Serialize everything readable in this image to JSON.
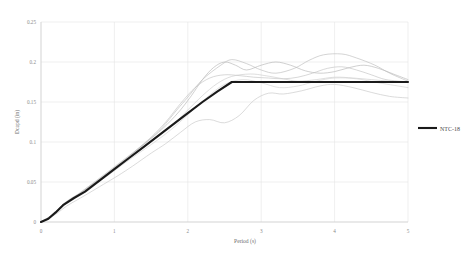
{
  "chart_data": {
    "type": "line",
    "title": "",
    "xlabel": "Period (s)",
    "ylabel": "Dcapd (in)",
    "xlim": [
      0,
      5
    ],
    "ylim": [
      0,
      0.25
    ],
    "xticks": [
      "0",
      "1",
      "2",
      "3",
      "4",
      "5"
    ],
    "yticks": [
      "0",
      "0.05",
      "0.1",
      "0.15",
      "0.2",
      "0.25"
    ],
    "grid": true,
    "legend_position": "right",
    "legend": [
      {
        "name": "NTC-18",
        "color": "#1a1a1a",
        "style": "solid-bold"
      }
    ],
    "series": [
      {
        "name": "NTC-18",
        "color": "#1a1a1a",
        "width": 2.1,
        "x": [
          0,
          0.1,
          0.2,
          0.3,
          0.45,
          0.6,
          0.8,
          1.0,
          1.2,
          1.4,
          1.6,
          1.8,
          2.0,
          2.2,
          2.4,
          2.6,
          2.8,
          3.0,
          3.5,
          4.0,
          4.5,
          5.0
        ],
        "y": [
          0,
          0.004,
          0.012,
          0.021,
          0.03,
          0.038,
          0.052,
          0.066,
          0.08,
          0.094,
          0.108,
          0.122,
          0.136,
          0.15,
          0.163,
          0.175,
          0.175,
          0.175,
          0.175,
          0.175,
          0.175,
          0.175
        ]
      },
      {
        "name": "record-1",
        "color": "#b6b6b6",
        "width": 0.65,
        "x": [
          0,
          0.1,
          0.2,
          0.3,
          0.4,
          0.55,
          0.7,
          0.85,
          1.0,
          1.2,
          1.4,
          1.6,
          1.75,
          1.9,
          2.05,
          2.2,
          2.35,
          2.5,
          2.65,
          2.8,
          3.0,
          3.2,
          3.4,
          3.6,
          3.8,
          4.0,
          4.2,
          4.4,
          4.6,
          4.8,
          5.0
        ],
        "y": [
          0,
          0.005,
          0.013,
          0.022,
          0.029,
          0.037,
          0.047,
          0.057,
          0.068,
          0.082,
          0.097,
          0.112,
          0.125,
          0.14,
          0.158,
          0.178,
          0.193,
          0.2,
          0.196,
          0.19,
          0.196,
          0.2,
          0.196,
          0.189,
          0.186,
          0.188,
          0.193,
          0.196,
          0.192,
          0.185,
          0.178
        ]
      },
      {
        "name": "record-2",
        "color": "#c2c2c2",
        "width": 0.65,
        "x": [
          0,
          0.12,
          0.25,
          0.4,
          0.55,
          0.7,
          0.9,
          1.1,
          1.3,
          1.5,
          1.7,
          1.9,
          2.1,
          2.3,
          2.5,
          2.7,
          2.9,
          3.1,
          3.3,
          3.5,
          3.7,
          3.9,
          4.1,
          4.3,
          4.5,
          4.7,
          5.0
        ],
        "y": [
          0,
          0.006,
          0.016,
          0.028,
          0.037,
          0.047,
          0.06,
          0.074,
          0.09,
          0.106,
          0.125,
          0.148,
          0.168,
          0.18,
          0.184,
          0.183,
          0.181,
          0.18,
          0.179,
          0.181,
          0.186,
          0.192,
          0.194,
          0.19,
          0.184,
          0.178,
          0.175
        ]
      },
      {
        "name": "record-3",
        "color": "#bdbdbd",
        "width": 0.65,
        "x": [
          0,
          0.15,
          0.3,
          0.45,
          0.6,
          0.8,
          1.0,
          1.2,
          1.45,
          1.65,
          1.85,
          2.0,
          2.2,
          2.45,
          2.6,
          2.8,
          3.0,
          3.2,
          3.45,
          3.65,
          3.85,
          4.1,
          4.3,
          4.55,
          4.75,
          5.0
        ],
        "y": [
          0,
          0.008,
          0.02,
          0.03,
          0.041,
          0.055,
          0.069,
          0.083,
          0.101,
          0.118,
          0.14,
          0.156,
          0.178,
          0.196,
          0.203,
          0.198,
          0.19,
          0.186,
          0.192,
          0.202,
          0.209,
          0.21,
          0.205,
          0.196,
          0.186,
          0.176
        ]
      },
      {
        "name": "record-4",
        "color": "#c8c8c8",
        "width": 0.65,
        "x": [
          0,
          0.1,
          0.22,
          0.35,
          0.5,
          0.65,
          0.85,
          1.05,
          1.25,
          1.5,
          1.7,
          1.9,
          2.1,
          2.3,
          2.5,
          2.7,
          2.9,
          3.1,
          3.3,
          3.55,
          3.8,
          4.0,
          4.25,
          4.5,
          4.75,
          5.0
        ],
        "y": [
          0,
          0.004,
          0.011,
          0.02,
          0.028,
          0.036,
          0.047,
          0.058,
          0.07,
          0.086,
          0.098,
          0.112,
          0.125,
          0.128,
          0.124,
          0.133,
          0.152,
          0.161,
          0.16,
          0.164,
          0.17,
          0.172,
          0.168,
          0.162,
          0.157,
          0.155
        ]
      },
      {
        "name": "record-5",
        "color": "#cccccc",
        "width": 0.65,
        "x": [
          0,
          0.12,
          0.28,
          0.42,
          0.58,
          0.75,
          0.95,
          1.15,
          1.35,
          1.55,
          1.8,
          2.0,
          2.2,
          2.4,
          2.6,
          2.85,
          3.05,
          3.3,
          3.5,
          3.75,
          4.0,
          4.25,
          4.5,
          4.75,
          5.0
        ],
        "y": [
          0,
          0.007,
          0.018,
          0.029,
          0.04,
          0.051,
          0.064,
          0.077,
          0.09,
          0.104,
          0.122,
          0.14,
          0.158,
          0.173,
          0.182,
          0.185,
          0.183,
          0.179,
          0.176,
          0.178,
          0.181,
          0.18,
          0.178,
          0.176,
          0.175
        ]
      },
      {
        "name": "record-6",
        "color": "#d2d2d2",
        "width": 0.65,
        "x": [
          0,
          0.15,
          0.32,
          0.5,
          0.68,
          0.88,
          1.1,
          1.3,
          1.55,
          1.78,
          2.0,
          2.25,
          2.5,
          2.75,
          3.0,
          3.25,
          3.5,
          3.75,
          4.0,
          4.3,
          4.6,
          5.0
        ],
        "y": [
          0,
          0.009,
          0.022,
          0.033,
          0.044,
          0.056,
          0.071,
          0.084,
          0.1,
          0.116,
          0.134,
          0.155,
          0.172,
          0.178,
          0.174,
          0.168,
          0.17,
          0.176,
          0.18,
          0.179,
          0.174,
          0.168
        ]
      }
    ]
  },
  "legend_entry": {
    "label": "NTC-18"
  },
  "axes": {
    "xlabel": "Period (s)",
    "ylabel": "Dcapd (in)"
  }
}
